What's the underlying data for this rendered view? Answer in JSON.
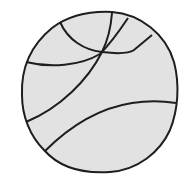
{
  "image": {
    "title": "Basketball line drawing",
    "subject": "basketball-icon"
  },
  "colors": {
    "background": "#ffffff",
    "fill": "#e2e2e2",
    "stroke": "#1e1e1e"
  }
}
